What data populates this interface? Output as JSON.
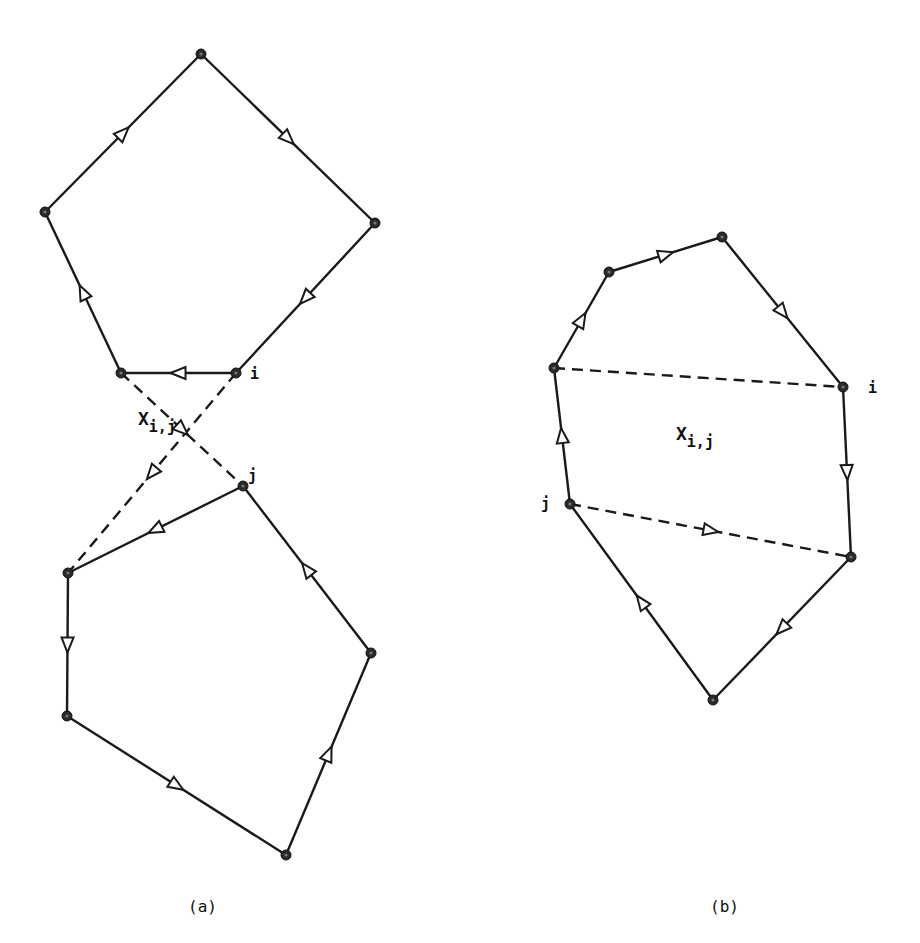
{
  "figure": {
    "panels": [
      {
        "id": "a",
        "caption": "(a)",
        "caption_pos": [
          188,
          912
        ],
        "region_label": {
          "main": "X",
          "sub": "i,j",
          "pos": [
            138,
            425
          ]
        },
        "vertex_labels": [
          {
            "text": "i",
            "pos": [
              250,
              379
            ]
          },
          {
            "text": "j",
            "pos": [
              248,
              481
            ]
          }
        ],
        "nodes": {
          "t": [
            201,
            54
          ],
          "l": [
            45,
            212
          ],
          "r": [
            375,
            223
          ],
          "a": [
            121,
            373
          ],
          "i": [
            236,
            373
          ],
          "j": [
            243,
            486
          ],
          "b": [
            68,
            573
          ],
          "c": [
            67,
            716
          ],
          "d": [
            286,
            855
          ],
          "e": [
            371,
            653
          ]
        },
        "edges": [
          {
            "from": "l",
            "to": "t",
            "style": "solid"
          },
          {
            "from": "t",
            "to": "r",
            "style": "solid"
          },
          {
            "from": "r",
            "to": "i",
            "style": "solid"
          },
          {
            "from": "i",
            "to": "a",
            "style": "solid"
          },
          {
            "from": "a",
            "to": "l",
            "style": "solid"
          },
          {
            "from": "a",
            "to": "j",
            "style": "dashed"
          },
          {
            "from": "i",
            "to": "b",
            "style": "dashed"
          },
          {
            "from": "j",
            "to": "b",
            "style": "solid"
          },
          {
            "from": "b",
            "to": "c",
            "style": "solid"
          },
          {
            "from": "c",
            "to": "d",
            "style": "solid"
          },
          {
            "from": "d",
            "to": "e",
            "style": "solid"
          },
          {
            "from": "e",
            "to": "j",
            "style": "solid"
          }
        ]
      },
      {
        "id": "b",
        "caption": "(b)",
        "caption_pos": [
          710,
          912
        ],
        "region_label": {
          "main": "X",
          "sub": "i,j",
          "pos": [
            676,
            440
          ]
        },
        "vertex_labels": [
          {
            "text": "i",
            "pos": [
              868,
              393
            ]
          },
          {
            "text": "j",
            "pos": [
              541,
              509
            ]
          }
        ],
        "nodes": {
          "p": [
            554,
            368
          ],
          "q": [
            609,
            272
          ],
          "s": [
            722,
            237
          ],
          "i": [
            843,
            387
          ],
          "u": [
            851,
            557
          ],
          "w": [
            713,
            700
          ],
          "j": [
            570,
            504
          ]
        },
        "edges": [
          {
            "from": "p",
            "to": "q",
            "style": "solid"
          },
          {
            "from": "q",
            "to": "s",
            "style": "solid"
          },
          {
            "from": "s",
            "to": "i",
            "style": "solid"
          },
          {
            "from": "i",
            "to": "u",
            "style": "solid"
          },
          {
            "from": "u",
            "to": "w",
            "style": "solid"
          },
          {
            "from": "w",
            "to": "j",
            "style": "solid"
          },
          {
            "from": "j",
            "to": "p",
            "style": "solid"
          },
          {
            "from": "p",
            "to": "i",
            "style": "dashed",
            "arrow": false
          },
          {
            "from": "j",
            "to": "u",
            "style": "dashed"
          }
        ]
      }
    ]
  }
}
